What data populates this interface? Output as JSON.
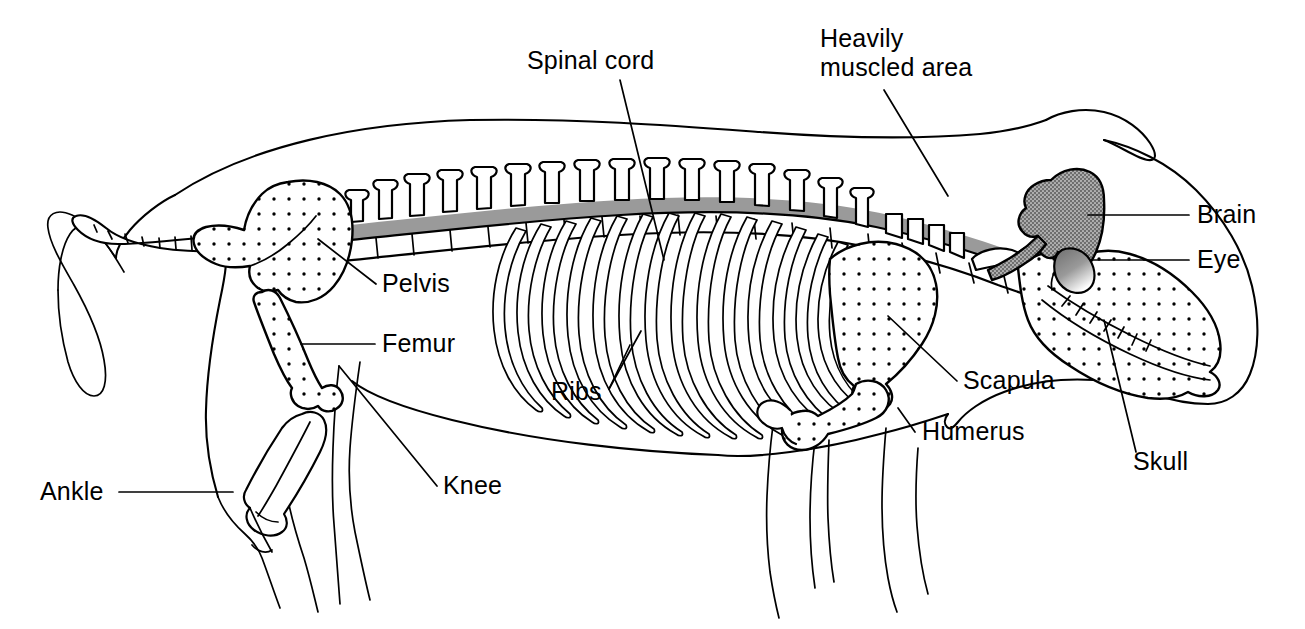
{
  "figure": {
    "view": "lateral left side, head at right",
    "background_color": "#ffffff",
    "line_color": "#000000",
    "brain_fill_color": "#808080",
    "spinal_cord_color": "#9a9a9a",
    "bone_fill": "white with stipple dots"
  },
  "labels": [
    {
      "id": "spinal-cord",
      "text": "Spinal cord",
      "lines": [
        "Spinal cord"
      ],
      "text_x": 527,
      "text_y": 69,
      "anchor": "start",
      "leader": "M 620 80 L 664 260"
    },
    {
      "id": "heavily-muscled-area",
      "text": "Heavily muscled area",
      "lines": [
        "Heavily",
        "muscled area"
      ],
      "text_x": 820,
      "text_y": 47,
      "anchor": "start",
      "leader": "M 884 90 L 948 196"
    },
    {
      "id": "brain",
      "text": "Brain",
      "lines": [
        "Brain"
      ],
      "text_x": 1197,
      "text_y": 223,
      "anchor": "start",
      "leader": "M 1189 215 L 1088 215"
    },
    {
      "id": "eye",
      "text": "Eye",
      "lines": [
        "Eye"
      ],
      "text_x": 1197,
      "text_y": 268,
      "anchor": "start",
      "leader": "M 1189 260 L 1091 260"
    },
    {
      "id": "pelvis",
      "text": "Pelvis",
      "lines": [
        "Pelvis"
      ],
      "text_x": 382,
      "text_y": 292,
      "anchor": "start",
      "leader": "M 376 284 L 318 239"
    },
    {
      "id": "femur",
      "text": "Femur",
      "lines": [
        "Femur"
      ],
      "text_x": 382,
      "text_y": 352,
      "anchor": "start",
      "leader": "M 375 344 L 301 344"
    },
    {
      "id": "ribs",
      "text": "Ribs",
      "lines": [
        "Ribs"
      ],
      "text_x": 551,
      "text_y": 400,
      "anchor": "start",
      "leader": "M 609 389 L 639 333 M 609 389 L 632 344"
    },
    {
      "id": "knee",
      "text": "Knee",
      "lines": [
        "Knee"
      ],
      "text_x": 443,
      "text_y": 494,
      "anchor": "start",
      "leader": "M 437 486 L 339 366"
    },
    {
      "id": "ankle",
      "text": "Ankle",
      "lines": [
        "Ankle"
      ],
      "text_x": 40,
      "text_y": 500,
      "anchor": "start",
      "leader": "M 119 492 L 230 492"
    },
    {
      "id": "scapula",
      "text": "Scapula",
      "lines": [
        "Scapula"
      ],
      "text_x": 963,
      "text_y": 389,
      "anchor": "start",
      "leader": "M 957 381 L 888 316"
    },
    {
      "id": "humerus",
      "text": "Humerus",
      "lines": [
        "Humerus"
      ],
      "text_x": 922,
      "text_y": 440,
      "anchor": "start",
      "leader": "M 915 432 L 900 410"
    },
    {
      "id": "skull",
      "text": "Skull",
      "lines": [
        "Skull"
      ],
      "text_x": 1133,
      "text_y": 470,
      "anchor": "start",
      "leader": "M 1136 452 L 1104 320"
    }
  ],
  "structures": [
    {
      "id": "body-outline",
      "name": "Body outline",
      "kind": "outline"
    },
    {
      "id": "tail",
      "name": "Tail vertebrae",
      "kind": "bone"
    },
    {
      "id": "spine",
      "name": "Vertebral column",
      "kind": "bone"
    },
    {
      "id": "spinal-cord-band",
      "name": "Spinal cord",
      "kind": "tissue"
    },
    {
      "id": "pelvis-bone",
      "name": "Pelvis",
      "kind": "bone"
    },
    {
      "id": "femur-bone",
      "name": "Femur",
      "kind": "bone"
    },
    {
      "id": "tibia-bone",
      "name": "Tibia / lower hind leg bone",
      "kind": "bone"
    },
    {
      "id": "rib-cage",
      "name": "Rib cage",
      "kind": "bone",
      "rib_count": 15
    },
    {
      "id": "scapula-bone",
      "name": "Scapula",
      "kind": "bone"
    },
    {
      "id": "humerus-bone",
      "name": "Humerus",
      "kind": "bone"
    },
    {
      "id": "skull-bone",
      "name": "Skull",
      "kind": "bone"
    },
    {
      "id": "brain-mass",
      "name": "Brain",
      "kind": "tissue"
    },
    {
      "id": "eye-ball",
      "name": "Eye",
      "kind": "tissue"
    }
  ]
}
